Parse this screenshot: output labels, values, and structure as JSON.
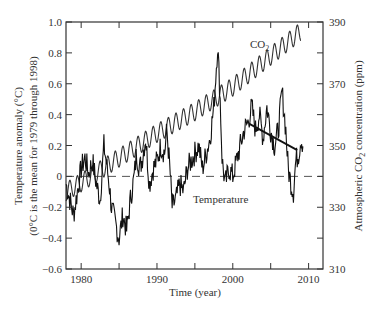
{
  "chart_data": {
    "type": "line",
    "title": "",
    "xlabel": "Time (year)",
    "ylabel": "Temperature anomaly (°C)",
    "ylabel_line2": "(0°C is the mean for 1979 through 1998)",
    "y2label_prefix": "Atmospheric CO",
    "y2label_sub": "2",
    "y2label_suffix": " concentration (ppm)",
    "xlim": [
      1978,
      2011.9
    ],
    "ylim": [
      -0.6,
      1.0
    ],
    "y2lim": [
      310,
      390
    ],
    "x_ticks": [
      1980,
      1990,
      2000,
      2010
    ],
    "x_minor_ticks": [
      1985,
      1995,
      2005
    ],
    "y_ticks": [
      1.0,
      0.8,
      0.6,
      0.4,
      0.2,
      0,
      -0.2,
      -0.4,
      -0.6
    ],
    "y_tick_labels": [
      "1.0",
      "0.8",
      "0.6",
      "0.4",
      "0.2",
      "0",
      "−0.2",
      "−0.4",
      "−0.6"
    ],
    "y2_ticks": [
      390,
      370,
      350,
      330,
      310
    ],
    "y2_minor_ticks": [
      380,
      360,
      340,
      320
    ],
    "grid": false,
    "legend": "none (inline annotations)",
    "annotations": {
      "co2_label": "CO",
      "co2_label_sub": "2",
      "temperature_label": "Temperature"
    },
    "reference_line": {
      "y": 0,
      "style": "dashed"
    },
    "series": [
      {
        "name": "CO2",
        "axis": "right",
        "description": "Seasonal oscillation (~±3 ppm) on rising trend",
        "x": [
          1978,
          1980,
          1985,
          1990,
          1995,
          2000,
          2005,
          2009
        ],
        "values": [
          335,
          338,
          346,
          354,
          361,
          369,
          379,
          387
        ]
      },
      {
        "name": "Temperature",
        "axis": "left",
        "description": "Monthly temperature anomaly (noisy)",
        "x": [
          1978.0,
          1978.5,
          1979.0,
          1979.5,
          1980.0,
          1980.5,
          1981.0,
          1981.5,
          1982.0,
          1982.5,
          1983.0,
          1983.3,
          1983.7,
          1984.0,
          1984.5,
          1985.0,
          1985.5,
          1986.0,
          1986.5,
          1987.0,
          1987.3,
          1987.7,
          1988.0,
          1988.5,
          1989.0,
          1989.5,
          1990.0,
          1990.5,
          1991.0,
          1991.3,
          1991.7,
          1992.0,
          1992.5,
          1993.0,
          1993.5,
          1994.0,
          1994.5,
          1995.0,
          1995.5,
          1996.0,
          1996.5,
          1997.0,
          1997.5,
          1998.0,
          1998.3,
          1998.6,
          1999.0,
          1999.5,
          2000.0,
          2000.5,
          2001.0,
          2001.5,
          2002.0,
          2002.5,
          2003.0,
          2003.5,
          2004.0,
          2004.5,
          2005.0,
          2005.5,
          2006.0,
          2006.5,
          2007.0,
          2007.3,
          2007.7,
          2008.0,
          2008.3,
          2008.7,
          2009.0,
          2009.3
        ],
        "values": [
          -0.05,
          -0.15,
          -0.25,
          -0.1,
          0.05,
          0.12,
          0.02,
          0.1,
          -0.05,
          -0.15,
          0.2,
          0.1,
          -0.05,
          -0.2,
          -0.3,
          -0.4,
          -0.25,
          -0.35,
          -0.15,
          0.0,
          0.15,
          0.05,
          0.1,
          0.25,
          -0.05,
          0.05,
          0.1,
          0.2,
          0.15,
          0.3,
          0.05,
          -0.2,
          -0.15,
          -0.05,
          -0.1,
          0.05,
          0.1,
          0.15,
          0.2,
          0.05,
          0.15,
          0.25,
          0.45,
          0.85,
          0.55,
          0.1,
          -0.05,
          0.05,
          0.0,
          0.1,
          0.2,
          0.3,
          0.35,
          0.45,
          0.3,
          0.4,
          0.25,
          0.45,
          0.3,
          0.2,
          0.3,
          0.55,
          0.3,
          0.05,
          -0.05,
          -0.1,
          0.1,
          0.15,
          0.25,
          0.2
        ]
      },
      {
        "name": "Temperature trend 2002-2009",
        "axis": "left",
        "description": "Straight linear fit segment",
        "x": [
          2002.2,
          2008.5
        ],
        "values": [
          0.34,
          0.17
        ]
      }
    ]
  }
}
